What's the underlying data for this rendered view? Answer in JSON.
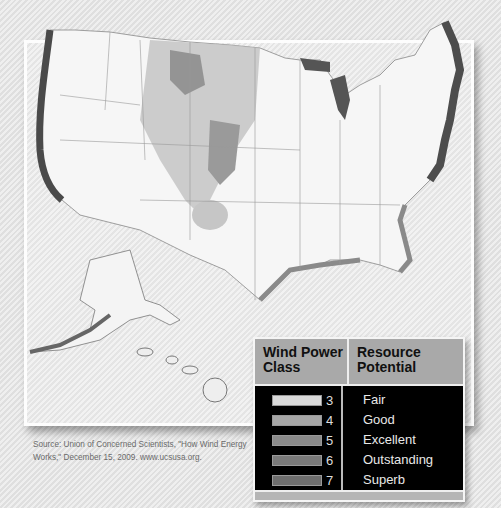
{
  "legend": {
    "header_class": "Wind Power\nClass",
    "header_class_line1": "Wind Power",
    "header_class_line2": "Class",
    "header_potential_line1": "Resource",
    "header_potential_line2": "Potential",
    "classes": [
      {
        "class": "3",
        "potential": "Fair",
        "color": "#d9d9d9"
      },
      {
        "class": "4",
        "potential": "Good",
        "color": "#a6a6a6"
      },
      {
        "class": "5",
        "potential": "Excellent",
        "color": "#8a8a8a"
      },
      {
        "class": "6",
        "potential": "Outstanding",
        "color": "#7a7a7a"
      },
      {
        "class": "7",
        "potential": "Superb",
        "color": "#6e6e6e"
      }
    ]
  },
  "source": "Source: Union of Concerned Scientists, \"How Wind Energy Works,\" December 15, 2009. www.ucsusa.org.",
  "map": {
    "regions": [
      "Contiguous United States",
      "Alaska",
      "Hawaii"
    ],
    "land_color": "#f7f7f7",
    "offshore_color": "#555555"
  }
}
